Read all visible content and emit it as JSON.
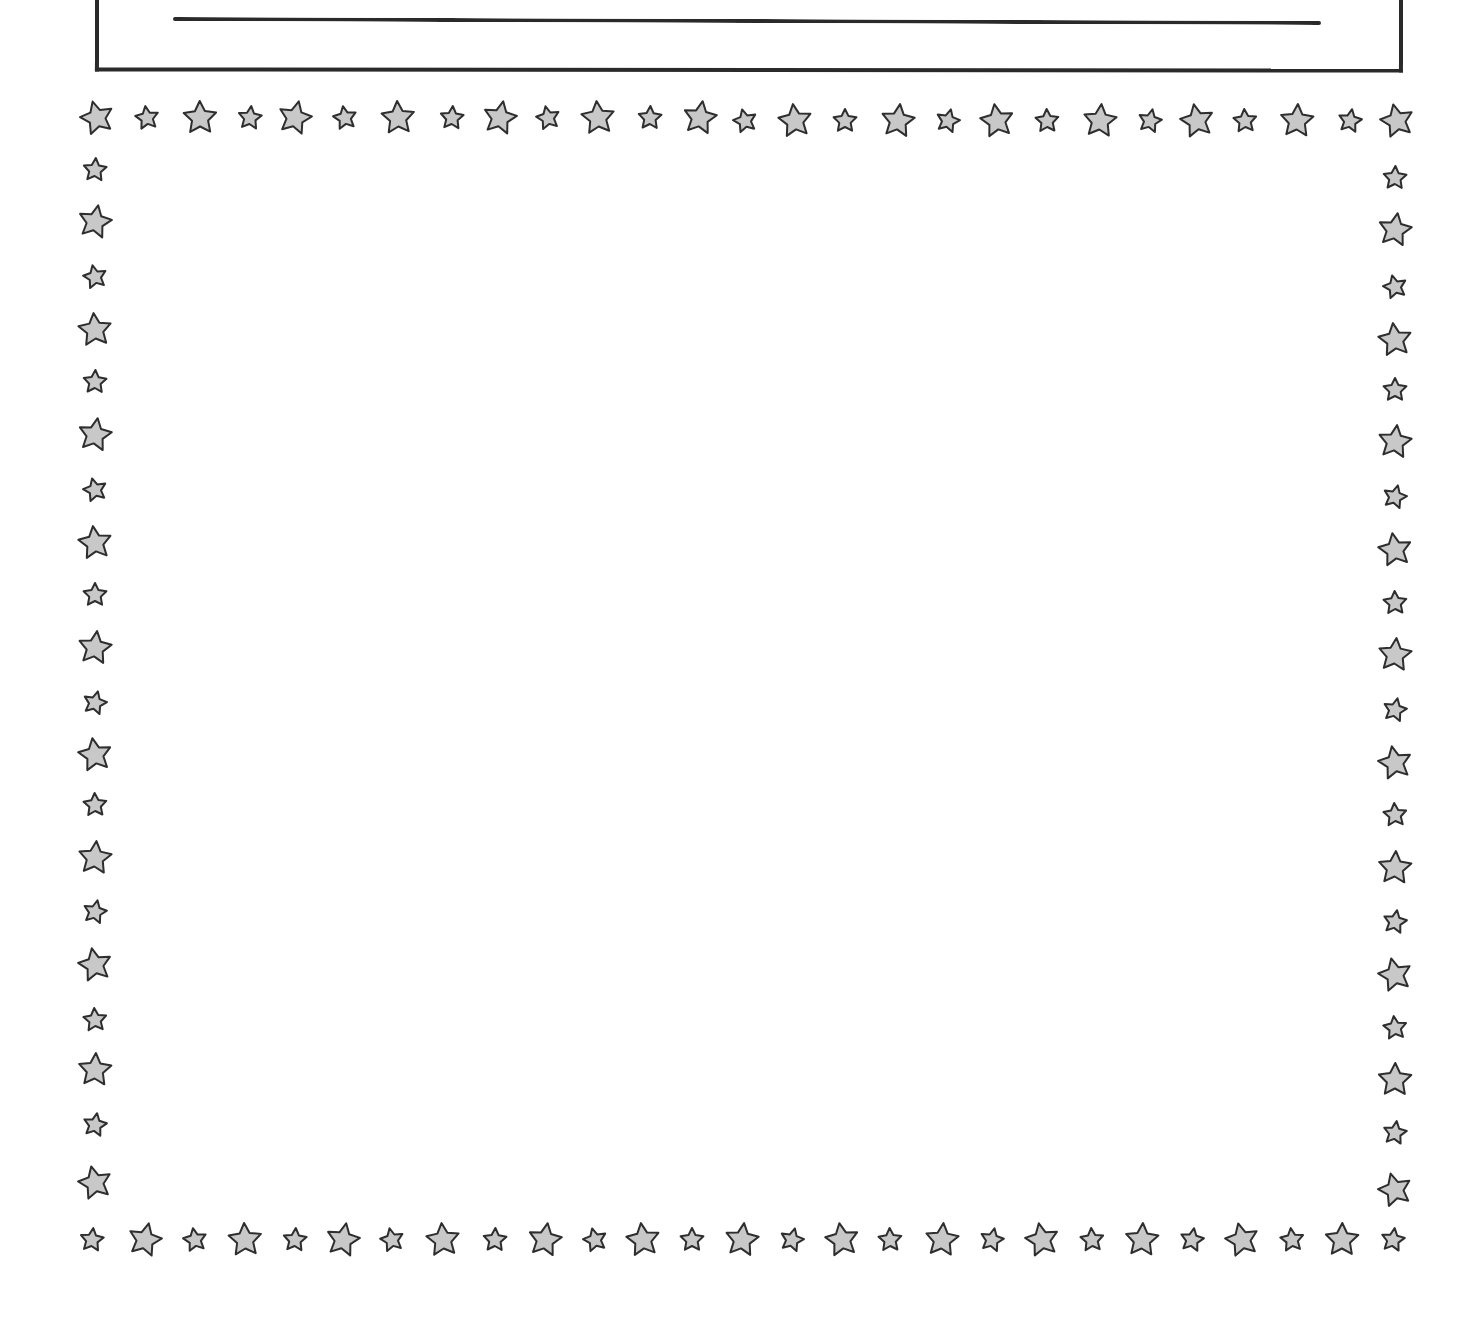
{
  "page": {
    "colors": {
      "line": "#2a2a2a",
      "star_fill": "#c8c8c8",
      "star_stroke": "#2e2e2e",
      "background": "#ffffff"
    }
  },
  "title_box": {
    "text": ""
  },
  "writing_area": {
    "text": ""
  },
  "star_border": {
    "icon": "star-icon",
    "large_size": 34,
    "small_size": 24,
    "top": {
      "y": 118,
      "x": [
        97,
        147,
        200,
        250,
        295,
        345,
        398,
        452,
        500,
        548,
        598,
        650,
        700,
        745,
        795,
        845,
        898,
        948,
        997,
        1047,
        1100,
        1150,
        1197,
        1245,
        1297,
        1350,
        1397
      ]
    },
    "bottom": {
      "y": 1240,
      "x": [
        92,
        145,
        195,
        245,
        295,
        343,
        392,
        443,
        495,
        545,
        595,
        643,
        692,
        742,
        792,
        842,
        890,
        942,
        992,
        1042,
        1092,
        1142,
        1192,
        1242,
        1292,
        1342,
        1393
      ]
    },
    "left": {
      "x": 95,
      "y": [
        170,
        222,
        277,
        330,
        382,
        435,
        490,
        543,
        595,
        648,
        703,
        755,
        805,
        858,
        912,
        965,
        1020,
        1070,
        1125,
        1183
      ]
    },
    "right": {
      "x": 1395,
      "y": [
        178,
        230,
        287,
        340,
        390,
        442,
        497,
        550,
        603,
        655,
        710,
        763,
        815,
        868,
        922,
        975,
        1028,
        1080,
        1133,
        1190
      ]
    }
  }
}
